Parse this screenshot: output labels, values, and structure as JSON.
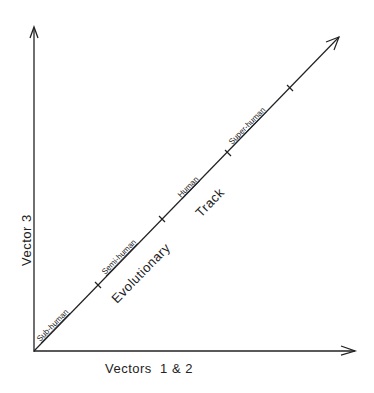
{
  "diagram": {
    "y_axis_label": "Vector 3",
    "x_axis_label": "Vectors  1 & 2",
    "track_label_1": "Evolutionary",
    "track_label_2": "Track",
    "stages": [
      {
        "label": "Sub-human"
      },
      {
        "label": "Semi-human"
      },
      {
        "label": "Human"
      },
      {
        "label": "Super-human"
      }
    ],
    "line_color": "#222222",
    "background_color": "#ffffff"
  }
}
